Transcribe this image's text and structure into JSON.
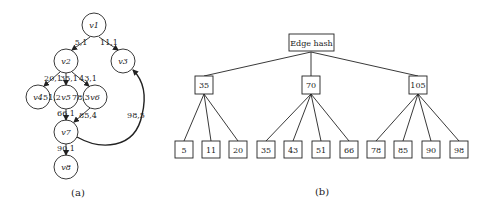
{
  "colors": {
    "stroke": "#222222",
    "background": "#ffffff"
  },
  "graph_a": {
    "caption": "(a)",
    "nodes": [
      {
        "id": "v1",
        "label": "v1",
        "cx": 94,
        "cy": 25
      },
      {
        "id": "v2",
        "label": "v2",
        "cx": 66,
        "cy": 61
      },
      {
        "id": "v3",
        "label": "v3",
        "cx": 123,
        "cy": 61
      },
      {
        "id": "v4",
        "label": "v4",
        "cx": 38,
        "cy": 97
      },
      {
        "id": "v5",
        "label": "v5",
        "cx": 66,
        "cy": 97
      },
      {
        "id": "v6",
        "label": "v6",
        "cx": 95,
        "cy": 97
      },
      {
        "id": "v7",
        "label": "v7",
        "cx": 66,
        "cy": 132
      },
      {
        "id": "v8",
        "label": "v8",
        "cx": 66,
        "cy": 167
      }
    ],
    "edges": [
      {
        "from": "v1",
        "to": "v2",
        "label": "5,1"
      },
      {
        "from": "v1",
        "to": "v3",
        "label": "11,1"
      },
      {
        "from": "v2",
        "to": "v4",
        "label": "20,1"
      },
      {
        "from": "v2",
        "to": "v5",
        "label": "35,1"
      },
      {
        "from": "v2",
        "to": "v6",
        "label": "43,1"
      },
      {
        "from": "v4",
        "to": "v5",
        "label": "51,2"
      },
      {
        "from": "v5",
        "to": "v6",
        "label": "78,3"
      },
      {
        "from": "v5",
        "to": "v7",
        "label": "66,1"
      },
      {
        "from": "v6",
        "to": "v7",
        "label": "85,4"
      },
      {
        "from": "v7",
        "to": "v3",
        "label": "98,5"
      },
      {
        "from": "v7",
        "to": "v8",
        "label": "90,1"
      }
    ]
  },
  "tree_b": {
    "caption": "(b)",
    "root": "Edge hash",
    "buckets": [
      {
        "label": "35",
        "children": [
          "5",
          "11",
          "20"
        ]
      },
      {
        "label": "70",
        "children": [
          "35",
          "43",
          "51",
          "66"
        ]
      },
      {
        "label": "105",
        "children": [
          "78",
          "85",
          "90",
          "98"
        ]
      }
    ]
  }
}
